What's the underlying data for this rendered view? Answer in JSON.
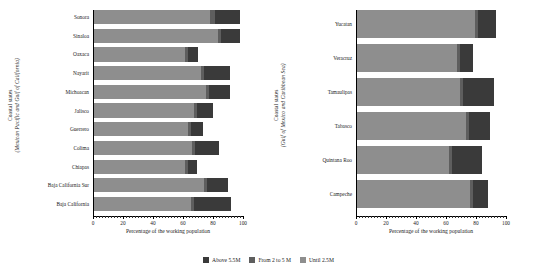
{
  "legend": {
    "position": "bottom-center",
    "items": [
      {
        "label": "Above 5.5M",
        "color": "#3a3a3a",
        "key": "above_5_5M"
      },
      {
        "label": "From 2 to 5 M",
        "color": "#5e5e5e",
        "key": "from_2_to_5M"
      },
      {
        "label": "Until 2.5M",
        "color": "#8e8e8e",
        "key": "until_2_5M"
      }
    ]
  },
  "panels": [
    {
      "id": "left",
      "ytitle_line1": "Coastal states",
      "ytitle_line2": "(Mexican Pacific and Gulf of California)",
      "xlabel": "Percentage of the working population",
      "xticks": [
        0,
        20,
        40,
        60,
        80,
        100
      ],
      "xticklabels": [
        "0",
        "20",
        "40",
        "60",
        "80",
        "100"
      ],
      "xlim": [
        0,
        100
      ]
    },
    {
      "id": "right",
      "ytitle_line1": "Coastal states",
      "ytitle_line2": "(Gulf of Mexico and Caribbean Sea)",
      "xlabel": "Percentage of the working population",
      "xticks": [
        0,
        20,
        40,
        60,
        80,
        100
      ],
      "xticklabels": [
        "0",
        "20",
        "40",
        "60",
        "80",
        "100"
      ],
      "xlim": [
        0,
        100
      ]
    }
  ],
  "chart_data": [
    {
      "type": "bar",
      "orientation": "horizontal",
      "stacked": true,
      "panel": "left",
      "title": "",
      "xlabel": "Percentage of the working population",
      "ylabel": "Coastal states (Mexican Pacific and Gulf of California)",
      "xlim": [
        0,
        100
      ],
      "grid": false,
      "legend_position": "bottom-center",
      "categories": [
        "Sonora",
        "Sinaloa",
        "Oaxaca",
        "Nayarit",
        "Michoacan",
        "Jalisco",
        "Guerrero",
        "Colima",
        "Chiapas",
        "Baja California Sur",
        "Baja California"
      ],
      "series": [
        {
          "name": "Until 2.5M",
          "color": "#8e8e8e",
          "values": [
            78,
            83,
            61,
            72,
            75,
            67,
            63,
            66,
            61,
            74,
            65
          ]
        },
        {
          "name": "From 2 to 5 M",
          "color": "#5e5e5e",
          "values": [
            3,
            2,
            2,
            2,
            2,
            2,
            2,
            2,
            2,
            2,
            2
          ]
        },
        {
          "name": "Above 5.5M",
          "color": "#3a3a3a",
          "values": [
            17,
            13,
            7,
            17,
            14,
            11,
            8,
            16,
            6,
            14,
            25
          ]
        }
      ]
    },
    {
      "type": "bar",
      "orientation": "horizontal",
      "stacked": true,
      "panel": "right",
      "title": "",
      "xlabel": "Percentage of the working population",
      "ylabel": "Coastal states (Gulf of Mexico and Caribbean Sea)",
      "xlim": [
        0,
        100
      ],
      "grid": false,
      "legend_position": "bottom-center",
      "categories": [
        "Yucatan",
        "Veracruz",
        "Tamaulipas",
        "Tabasco",
        "Quintana Roo",
        "Campeche"
      ],
      "series": [
        {
          "name": "Until 2.5M",
          "color": "#8e8e8e",
          "values": [
            79,
            67,
            69,
            73,
            62,
            76
          ]
        },
        {
          "name": "From 2 to 5 M",
          "color": "#5e5e5e",
          "values": [
            2,
            2,
            2,
            2,
            2,
            2
          ]
        },
        {
          "name": "Above 5.5M",
          "color": "#3a3a3a",
          "values": [
            12,
            9,
            21,
            14,
            20,
            10
          ]
        }
      ]
    }
  ]
}
